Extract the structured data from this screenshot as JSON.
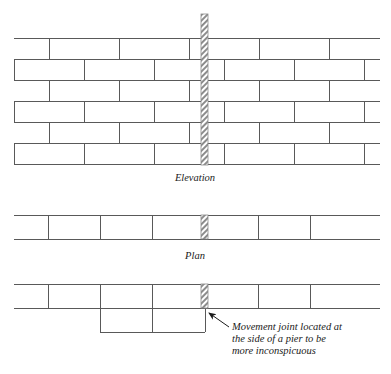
{
  "figure": {
    "background_color": "#ffffff",
    "line_color": "#595959",
    "joint_hatch_color": "#8c8c8c",
    "text_color": "#1a1a1a"
  },
  "views": [
    {
      "id": "elevation",
      "caption": "Elevation",
      "caption_x": 195,
      "caption_y": 181,
      "bounds": {
        "x": 14,
        "y": 38,
        "width": 366,
        "height": 126
      },
      "course_count": 6,
      "course_height": 21,
      "bond": "stretcher bond",
      "brick_length": 70,
      "courses": [
        {
          "index": 0,
          "offset": 35,
          "y_top": 38
        },
        {
          "index": 1,
          "offset": 0,
          "y_top": 59
        },
        {
          "index": 2,
          "offset": 35,
          "y_top": 80
        },
        {
          "index": 3,
          "offset": 0,
          "y_top": 101
        },
        {
          "index": 4,
          "offset": 35,
          "y_top": 122
        },
        {
          "index": 5,
          "offset": 0,
          "y_top": 143
        }
      ]
    },
    {
      "id": "plan-through-wall",
      "caption": "Plan",
      "caption_x": 195,
      "caption_y": 259,
      "bounds": {
        "x": 14,
        "y": 215,
        "width": 366,
        "height": 24
      },
      "divider_positions": [
        48,
        100,
        152,
        258,
        310
      ]
    },
    {
      "id": "plan-with-pier",
      "caption": "",
      "caption_x": 0,
      "caption_y": 0,
      "bounds": {
        "x": 14,
        "y": 284,
        "width": 366,
        "height": 24
      },
      "divider_positions": [
        48,
        100,
        152,
        258,
        310
      ],
      "pier": {
        "x": 100,
        "y": 308,
        "width": 105,
        "height": 24,
        "divider_x": 152
      }
    }
  ],
  "movement_joint": {
    "label": "movement joint",
    "x": 201,
    "width": 7,
    "elevation_top": 14,
    "elevation_bottom": 165,
    "plan_top": 215,
    "plan_bottom": 239,
    "plan_pier_top": 284,
    "plan_pier_bottom": 308
  },
  "annotation": {
    "lines": [
      "Movement joint located at",
      "the side of a pier to be",
      "more inconspicuous"
    ],
    "text_x": 232,
    "text_y_start": 327,
    "line_height": 12,
    "leader": {
      "from_x": 229,
      "from_y": 327,
      "to_x": 206,
      "to_y": 311,
      "arrow_head": "filled-triangle"
    }
  }
}
